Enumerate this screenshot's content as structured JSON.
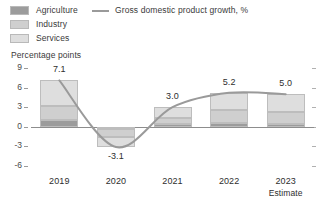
{
  "legend": {
    "series": [
      {
        "label": "Agriculture",
        "color": "#9c9c9c",
        "icon": "legend-swatch-icon"
      },
      {
        "label": "Industry",
        "color": "#cfcfcf",
        "icon": "legend-swatch-icon"
      },
      {
        "label": "Services",
        "color": "#dedede",
        "icon": "legend-swatch-icon"
      }
    ],
    "line": {
      "label": "Gross domestic product growth, %",
      "color": "#9a9a9a",
      "icon": "legend-line-icon"
    }
  },
  "axis": {
    "y_title": "Percentage points",
    "y_ticks": [
      "9",
      "6",
      "3",
      "0",
      "-3",
      "-6"
    ],
    "x_ticks": [
      "2019",
      "2020",
      "2021",
      "2022",
      "2023"
    ],
    "x_sub_note": "Estimate"
  },
  "data_labels": [
    "7.1",
    "-3.1",
    "3.0",
    "5.2",
    "5.0"
  ],
  "chart_data": {
    "type": "bar",
    "title": "",
    "subtitle": "",
    "xlabel": "",
    "ylabel": "Percentage points",
    "ylim": [
      -6,
      9
    ],
    "yticks": [
      9,
      6,
      3,
      0,
      -3,
      -6
    ],
    "grid": false,
    "legend_position": "top-left",
    "categories": [
      "2019",
      "2020",
      "2021",
      "2022",
      "2023"
    ],
    "category_notes": [
      "",
      "",
      "",
      "",
      "Estimate"
    ],
    "stacked": true,
    "series": [
      {
        "name": "Agriculture",
        "color": "#9c9c9c",
        "values": [
          1.0,
          -0.3,
          0.4,
          0.6,
          0.5
        ]
      },
      {
        "name": "Industry",
        "color": "#cfcfcf",
        "values": [
          2.2,
          -1.2,
          1.0,
          1.9,
          1.8
        ]
      },
      {
        "name": "Services",
        "color": "#dedede",
        "values": [
          3.9,
          -1.6,
          1.6,
          2.7,
          2.7
        ]
      }
    ],
    "overlay_line": {
      "name": "Gross domestic product growth, %",
      "color": "#9a9a9a",
      "values": [
        7.1,
        -3.1,
        3.0,
        5.2,
        5.0
      ]
    },
    "point_labels": [
      "7.1",
      "-3.1",
      "3.0",
      "5.2",
      "5.0"
    ]
  }
}
